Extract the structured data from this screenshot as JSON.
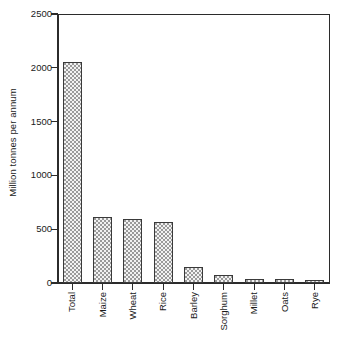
{
  "figure": {
    "title_fragment": "",
    "background_color": "#ffffff",
    "frame_color": "#2b2b2b",
    "bar_fill_color": "#f2f2f2",
    "bar_pattern_dot_color": "#9a9a9a",
    "bar_border_color": "#3a3a3a"
  },
  "chart_data": {
    "type": "bar",
    "title": "",
    "xlabel": "",
    "ylabel": "Million tonnes per annum",
    "categories": [
      "Total",
      "Maize",
      "Wheat",
      "Rice",
      "Barley",
      "Sorghum",
      "Millet",
      "Oats",
      "Rye"
    ],
    "values": [
      2050,
      610,
      595,
      570,
      145,
      75,
      40,
      35,
      25
    ],
    "ylim": [
      0,
      2500
    ],
    "yticks": [
      0,
      500,
      1000,
      1500,
      2000,
      2500
    ],
    "ytick_labels": [
      "0",
      "500",
      "1000",
      "1500",
      "2000",
      "2500"
    ],
    "grid": false,
    "legend": false,
    "xtick_label_rotation": 90,
    "series": [
      {
        "name": "Annual production",
        "values": [
          2050,
          610,
          595,
          570,
          145,
          75,
          40,
          35,
          25
        ]
      }
    ]
  }
}
